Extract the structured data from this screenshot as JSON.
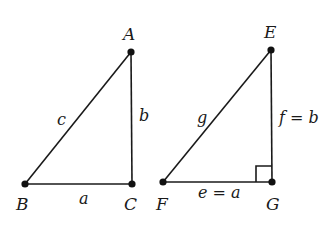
{
  "colors": {
    "ink": "#1a1a1a",
    "background": "#ffffff"
  },
  "triangles": [
    {
      "name": "ABC",
      "vertices": {
        "A": {
          "label": "A",
          "x": 131,
          "y": 52
        },
        "B": {
          "label": "B",
          "x": 25,
          "y": 184
        },
        "C": {
          "label": "C",
          "x": 132,
          "y": 184
        }
      },
      "sides": {
        "hypotenuse": {
          "label": "c"
        },
        "vertical": {
          "label": "b"
        },
        "base": {
          "label": "a"
        }
      },
      "right_angle_marker": false
    },
    {
      "name": "EFG",
      "vertices": {
        "E": {
          "label": "E",
          "x": 271,
          "y": 50
        },
        "F": {
          "label": "F",
          "x": 163,
          "y": 182
        },
        "G": {
          "label": "G",
          "x": 272,
          "y": 182
        }
      },
      "sides": {
        "hypotenuse": {
          "label": "g"
        },
        "vertical": {
          "label": "f = b"
        },
        "base": {
          "label": "e = a"
        }
      },
      "right_angle_marker": true
    }
  ]
}
